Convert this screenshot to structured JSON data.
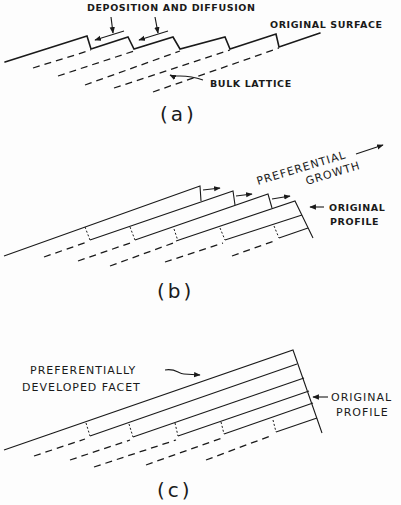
{
  "figure": {
    "panel_a": {
      "caption": "(a)",
      "labels": {
        "deposition": "DEPOSITION AND DIFFUSION",
        "original_surface": "ORIGINAL SURFACE",
        "bulk_lattice": "BULK LATTICE"
      }
    },
    "panel_b": {
      "caption": "(b)",
      "labels": {
        "preferential": "PREFERENTIAL",
        "growth": "GROWTH",
        "original": "ORIGINAL",
        "profile": "PROFILE"
      }
    },
    "panel_c": {
      "caption": "(c)",
      "labels": {
        "preferentially": "PREFERENTIALLY",
        "developed_facet": "DEVELOPED FACET",
        "original": "ORIGINAL",
        "profile": "PROFILE"
      }
    }
  }
}
